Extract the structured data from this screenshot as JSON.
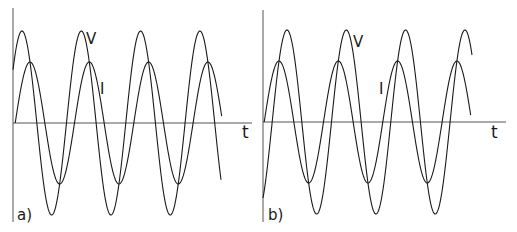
{
  "figure": {
    "panels": [
      {
        "id": "a",
        "label": "a)",
        "x_axis_label": "t",
        "voltage_label": "V",
        "current_label": "I",
        "relationship": "current lags voltage",
        "geometry": {
          "origin_x": 13,
          "axis_y": 123,
          "axis_top": 8,
          "axis_bottom": 222,
          "axis_right": 252,
          "v_amp": 92,
          "i_amp": 61,
          "period": 59.3,
          "v_first_peak_x": 22,
          "i_first_peak_x": 30,
          "v_end_x": 221,
          "i_end_x": 222
        },
        "label_pos": {
          "V": [
            86,
            32
          ],
          "I": [
            100,
            82
          ],
          "t": [
            242,
            124
          ],
          "panel": [
            17,
            208
          ]
        }
      },
      {
        "id": "b",
        "label": "b)",
        "x_axis_label": "t",
        "voltage_label": "V",
        "current_label": "I",
        "relationship": "current leads voltage",
        "geometry": {
          "origin_x": 263,
          "axis_y": 122,
          "axis_top": 10,
          "axis_bottom": 222,
          "axis_right": 506,
          "v_amp": 92,
          "i_amp": 61,
          "period": 59.3,
          "v_first_peak_x": 287,
          "i_first_peak_x": 279,
          "v_end_x": 472,
          "i_end_x": 471
        },
        "label_pos": {
          "V": [
            353,
            35
          ],
          "I": [
            379,
            82
          ],
          "t": [
            491,
            124
          ],
          "panel": [
            268,
            208
          ]
        }
      }
    ],
    "colors": {
      "curve": "#1a1a1a",
      "axis": "#555555",
      "background": "#ffffff"
    }
  }
}
